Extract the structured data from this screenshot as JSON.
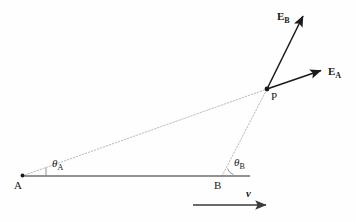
{
  "figure": {
    "type": "vector-geometry-diagram",
    "background_color": "#fefefe",
    "ink_color": "#1a1a1a",
    "baseline_color": "#6e6e6e",
    "dashed_color": "#b9b9b9"
  },
  "points": [
    {
      "id": "A",
      "label": "A",
      "x": 22,
      "y": 176,
      "label_x": 14,
      "label_y": 182
    },
    {
      "id": "B",
      "label": "B",
      "x": 222,
      "y": 176,
      "label_x": 215,
      "label_y": 182
    },
    {
      "id": "P",
      "label": "P",
      "x": 267,
      "y": 89,
      "label_x": 271,
      "label_y": 92
    }
  ],
  "baseline": {
    "name": "horizontal-baseline",
    "x1": 22,
    "y1": 176,
    "x2": 250,
    "y2": 176,
    "color": "#6e6e6e",
    "width": 1.6
  },
  "sight_lines": [
    {
      "name": "sight-line-A-to-P",
      "from": "A",
      "to": "P",
      "x1": 22,
      "y1": 176,
      "x2": 267,
      "y2": 89,
      "style": "dotted"
    },
    {
      "name": "sight-line-B-to-P",
      "from": "B",
      "to": "P",
      "x1": 222,
      "y1": 176,
      "x2": 267,
      "y2": 89,
      "style": "dotted"
    }
  ],
  "angles": [
    {
      "id": "theta_A",
      "symbol": "θ",
      "subscript": "A",
      "vertex": "A",
      "label_x": 52,
      "label_y": 160,
      "tick_x1": 46,
      "tick_y1": 176,
      "tick_x2": 46,
      "tick_y2": 167
    },
    {
      "id": "theta_B",
      "symbol": "θ",
      "subscript": "B",
      "vertex": "B",
      "label_x": 233,
      "label_y": 159,
      "tick_x1": 228,
      "tick_y1": 170,
      "tick_x2": 234,
      "tick_y2": 174
    }
  ],
  "vectors": [
    {
      "id": "E_B",
      "symbol": "E",
      "subscript": "B",
      "from": "P",
      "x1": 267,
      "y1": 89,
      "x2": 305,
      "y2": 13,
      "label_x": 279,
      "label_y": 14,
      "color": "#1a1a1a"
    },
    {
      "id": "E_A",
      "symbol": "E",
      "subscript": "A",
      "from": "P",
      "x1": 267,
      "y1": 89,
      "x2": 325,
      "y2": 69,
      "label_x": 329,
      "label_y": 72,
      "color": "#1a1a1a"
    },
    {
      "id": "v",
      "symbol": "v",
      "subscript": "",
      "from": "free",
      "x1": 193,
      "y1": 205,
      "x2": 271,
      "y2": 205,
      "label_x": 247,
      "label_y": 190,
      "color": "#3a3a3a"
    }
  ],
  "labels": {
    "point_a": "A",
    "point_b": "B",
    "point_p": "P",
    "vector_eb": "E",
    "vector_eb_sub": "B",
    "vector_ea": "E",
    "vector_ea_sub": "A",
    "angle_a": "θ",
    "angle_a_sub": "A",
    "angle_b": "θ",
    "angle_b_sub": "B",
    "velocity": "v"
  }
}
